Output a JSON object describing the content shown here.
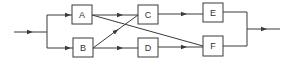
{
  "diagram": {
    "type": "flow-network",
    "colors": {
      "stroke": "#3a3a3a",
      "background": "#ffffff"
    },
    "nodes": [
      {
        "id": "A",
        "label": "A",
        "x": 72,
        "y": 5,
        "w": 20,
        "h": 19
      },
      {
        "id": "B",
        "label": "B",
        "x": 73,
        "y": 38,
        "w": 20,
        "h": 19
      },
      {
        "id": "C",
        "label": "C",
        "x": 138,
        "y": 5,
        "w": 20,
        "h": 19
      },
      {
        "id": "D",
        "label": "D",
        "x": 138,
        "y": 38,
        "w": 20,
        "h": 19
      },
      {
        "id": "E",
        "label": "E",
        "x": 203,
        "y": 3,
        "w": 20,
        "h": 19
      },
      {
        "id": "F",
        "label": "F",
        "x": 203,
        "y": 36,
        "w": 20,
        "h": 20
      }
    ],
    "edges": [
      {
        "from": "input",
        "to": "A"
      },
      {
        "from": "input",
        "to": "B"
      },
      {
        "from": "A",
        "to": "C"
      },
      {
        "from": "A",
        "to": "F"
      },
      {
        "from": "B",
        "to": "C"
      },
      {
        "from": "B",
        "to": "D"
      },
      {
        "from": "C",
        "to": "E"
      },
      {
        "from": "D",
        "to": "F"
      },
      {
        "from": "E",
        "to": "output"
      },
      {
        "from": "F",
        "to": "output"
      }
    ]
  }
}
